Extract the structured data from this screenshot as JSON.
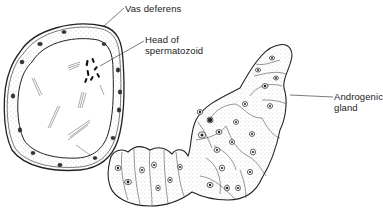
{
  "figure": {
    "type": "biological illustration",
    "top_right_cut_text": "........",
    "labels": [
      {
        "id": "vas-deferens",
        "text": "Vas deferens"
      },
      {
        "id": "head-of-spermatozoid",
        "line1": "Head of",
        "line2": "spermatozoid"
      },
      {
        "id": "androgenic-gland",
        "line1": "Androgenic",
        "line2": "gland"
      }
    ],
    "colors": {
      "ink": "#222222",
      "stipple": "#9a9a9a",
      "background": "#ffffff"
    }
  }
}
